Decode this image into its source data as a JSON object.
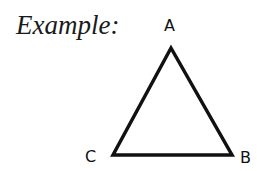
{
  "title": "Example:",
  "diagram": {
    "shape": "triangle",
    "stroke_color": "#111111",
    "vertices": [
      {
        "label": "A",
        "x": 171,
        "y": 48
      },
      {
        "label": "B",
        "x": 232,
        "y": 155
      },
      {
        "label": "C",
        "x": 113,
        "y": 155
      }
    ]
  }
}
